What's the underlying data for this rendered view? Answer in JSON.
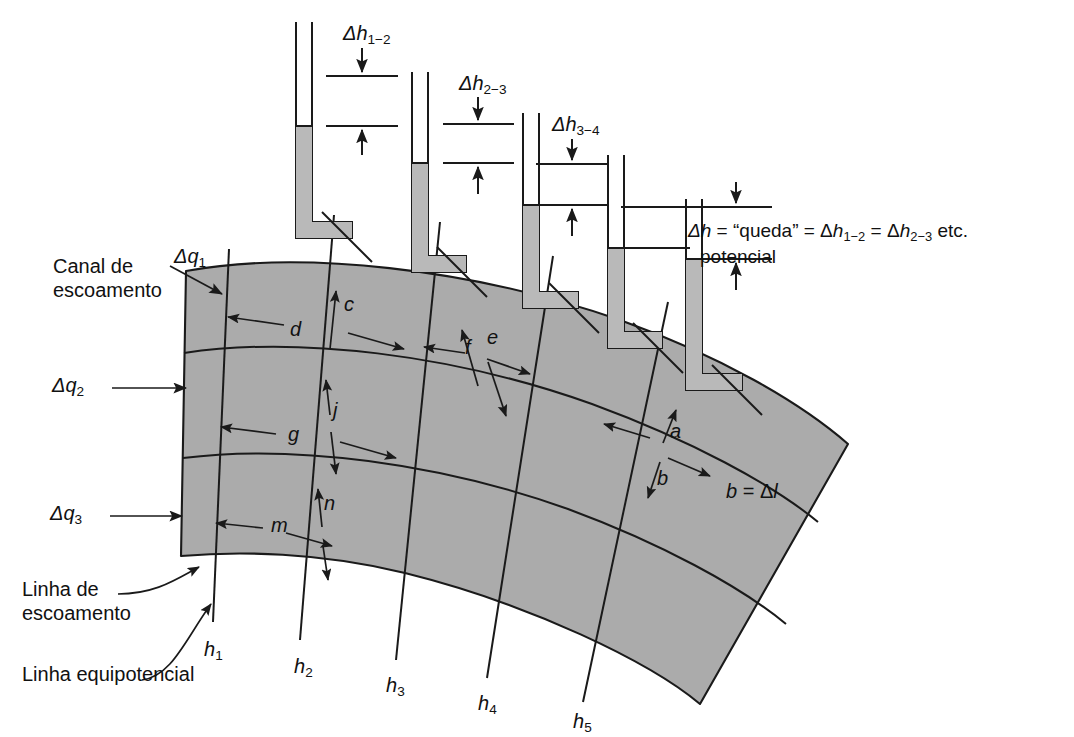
{
  "figure": {
    "background_color": "#ffffff",
    "fill_color": "#ababab",
    "line_color": "#1a1a1a"
  },
  "piezometers": [
    {
      "id": "tube1",
      "water_level_label": "h1"
    },
    {
      "id": "tube2",
      "water_level_label": "h2"
    },
    {
      "id": "tube3",
      "water_level_label": "h3"
    },
    {
      "id": "tube4",
      "water_level_label": "h4"
    },
    {
      "id": "tube5",
      "water_level_label": "h5"
    }
  ],
  "head_drops": [
    {
      "name": "delta-h-1-2",
      "symbol": "Δ",
      "var": "h",
      "sub": "1−2"
    },
    {
      "name": "delta-h-2-3",
      "symbol": "Δ",
      "var": "h",
      "sub": "2−3"
    },
    {
      "name": "delta-h-3-4",
      "symbol": "Δ",
      "var": "h",
      "sub": "3−4"
    }
  ],
  "legend": {
    "line1_a": "Δ",
    "line1_b": "h",
    "line1_c": " = “queda” = Δ",
    "line1_d": "h",
    "line1_sub1": "1−2",
    "line1_e": " = Δ",
    "line1_f": "h",
    "line1_sub2": "2−3",
    "line1_g": " etc.",
    "line2": "potencial"
  },
  "flow_channels": [
    {
      "label_sym": "Δ",
      "label_var": "q",
      "label_sub": "1"
    },
    {
      "label_sym": "Δ",
      "label_var": "q",
      "label_sub": "2"
    },
    {
      "label_sym": "Δ",
      "label_var": "q",
      "label_sub": "3"
    }
  ],
  "annotations": {
    "flow_channel_title_line1": "Canal de",
    "flow_channel_title_line2": "escoamento",
    "flow_line_label_line1": "Linha de",
    "flow_line_label_line2": "escoamento",
    "equipotential_label": "Linha equipotencial",
    "b_equals_dl_b": "b",
    "b_equals_dl_eq": " = Δ",
    "b_equals_dl_l": "l"
  },
  "cell_dimension_letters": [
    {
      "letter": "c",
      "orientation": "vertical"
    },
    {
      "letter": "d",
      "orientation": "horizontal"
    },
    {
      "letter": "e",
      "orientation": "vertical"
    },
    {
      "letter": "f",
      "orientation": "horizontal"
    },
    {
      "letter": "j",
      "orientation": "vertical"
    },
    {
      "letter": "g",
      "orientation": "horizontal"
    },
    {
      "letter": "n",
      "orientation": "vertical"
    },
    {
      "letter": "m",
      "orientation": "horizontal"
    },
    {
      "letter": "a",
      "orientation": "horizontal"
    },
    {
      "letter": "b",
      "orientation": "vertical"
    }
  ],
  "equipotential_labels": [
    {
      "var": "h",
      "sub": "1"
    },
    {
      "var": "h",
      "sub": "2"
    },
    {
      "var": "h",
      "sub": "3"
    },
    {
      "var": "h",
      "sub": "4"
    },
    {
      "var": "h",
      "sub": "5"
    }
  ]
}
